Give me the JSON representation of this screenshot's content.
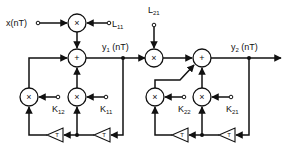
{
  "diagram": {
    "title": "",
    "type": "signal-flow block diagram (cascaded recursive filter sections)",
    "inputs": {
      "x": {
        "label": "x(nT)"
      },
      "L11": {
        "label": "L",
        "sub": "11"
      },
      "L21": {
        "label": "L",
        "sub": "21"
      },
      "K11": {
        "label": "K",
        "sub": "11"
      },
      "K12": {
        "label": "K",
        "sub": "12"
      },
      "K21": {
        "label": "K",
        "sub": "21"
      },
      "K22": {
        "label": "K",
        "sub": "22"
      }
    },
    "outputs": {
      "y1": {
        "label": "y",
        "sub": "1",
        "suffix": " (nT)"
      },
      "y2": {
        "label": "y",
        "sub": "2",
        "suffix": " (nT)"
      }
    },
    "symbols": {
      "multiply": "×",
      "add": "+",
      "delay": "T"
    },
    "blocks": [
      {
        "id": "mult-L11",
        "type": "multiplier",
        "symbol": "×"
      },
      {
        "id": "add-1",
        "type": "adder",
        "symbol": "+"
      },
      {
        "id": "mult-K12",
        "type": "multiplier",
        "symbol": "×"
      },
      {
        "id": "mult-K11",
        "type": "multiplier",
        "symbol": "×"
      },
      {
        "id": "delay-1a",
        "type": "delay",
        "symbol": "T"
      },
      {
        "id": "delay-1b",
        "type": "delay",
        "symbol": "T"
      },
      {
        "id": "mult-L21",
        "type": "multiplier",
        "symbol": "×"
      },
      {
        "id": "add-2",
        "type": "adder",
        "symbol": "+"
      },
      {
        "id": "mult-K22",
        "type": "multiplier",
        "symbol": "×"
      },
      {
        "id": "mult-K21",
        "type": "multiplier",
        "symbol": "×"
      },
      {
        "id": "delay-2a",
        "type": "delay",
        "symbol": "T"
      },
      {
        "id": "delay-2b",
        "type": "delay",
        "symbol": "T"
      }
    ],
    "edges": [
      [
        "x",
        "mult-L11"
      ],
      [
        "L11",
        "mult-L11"
      ],
      [
        "mult-L11",
        "add-1"
      ],
      [
        "add-1",
        "y1"
      ],
      [
        "y1",
        "delay-1b"
      ],
      [
        "delay-1b",
        "mult-K11"
      ],
      [
        "delay-1b",
        "delay-1a"
      ],
      [
        "delay-1a",
        "mult-K12"
      ],
      [
        "K11",
        "mult-K11"
      ],
      [
        "K12",
        "mult-K12"
      ],
      [
        "mult-K11",
        "add-1"
      ],
      [
        "mult-K12",
        "add-1"
      ],
      [
        "y1",
        "mult-L21"
      ],
      [
        "L21",
        "mult-L21"
      ],
      [
        "mult-L21",
        "add-2"
      ],
      [
        "add-2",
        "y2"
      ],
      [
        "y2",
        "delay-2b"
      ],
      [
        "delay-2b",
        "mult-K21"
      ],
      [
        "delay-2b",
        "delay-2a"
      ],
      [
        "delay-2a",
        "mult-K22"
      ],
      [
        "K21",
        "mult-K21"
      ],
      [
        "K22",
        "mult-K22"
      ],
      [
        "mult-K21",
        "add-2"
      ],
      [
        "mult-K22",
        "add-2"
      ]
    ],
    "colors": {
      "ink": "#111111",
      "background": "#ffffff"
    }
  }
}
